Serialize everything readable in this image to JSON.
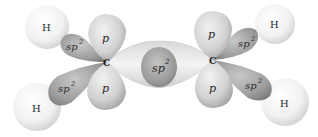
{
  "diagram": {
    "colors": {
      "background": "#ffffff",
      "hydrogen_light": "#fbfbfb",
      "hydrogen_dark": "#c9c9c9",
      "lobe_light": "#e6e6e6",
      "lobe_dark": "#8a8a8a",
      "text": "#2a2a2a"
    },
    "atoms": {
      "carbon_left": {
        "label": "C",
        "x": 107,
        "y": 62
      },
      "carbon_right": {
        "label": "C",
        "x": 213,
        "y": 60
      },
      "hydrogen_left_top": {
        "label": "H",
        "x": 47,
        "y": 27
      },
      "hydrogen_left_bottom": {
        "label": "H",
        "x": 37,
        "y": 107
      },
      "hydrogen_right_top": {
        "label": "H",
        "x": 275,
        "y": 24
      },
      "hydrogen_right_bottom": {
        "label": "H",
        "x": 285,
        "y": 102
      }
    },
    "orbitals": {
      "left_p_top": {
        "label": "p"
      },
      "left_p_bottom": {
        "label": "p"
      },
      "left_sp2_top": {
        "label": "sp",
        "sup": "2"
      },
      "left_sp2_bottom": {
        "label": "sp",
        "sup": "2"
      },
      "center_sp2_bond": {
        "label": "sp",
        "sup": "2"
      },
      "right_p_top": {
        "label": "p"
      },
      "right_p_bottom": {
        "label": "p"
      },
      "right_sp2_top": {
        "label": "sp",
        "sup": "2"
      },
      "right_sp2_bottom": {
        "label": "sp",
        "sup": "2"
      }
    }
  }
}
